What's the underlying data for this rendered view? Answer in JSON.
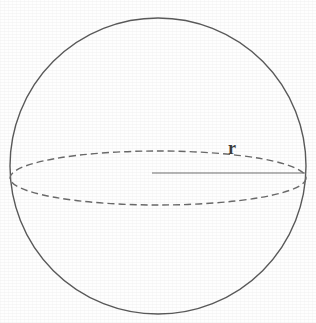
{
  "figure": {
    "kind": "sphere-radius-diagram",
    "background_color": "#fefefe",
    "width": 316,
    "height": 323
  },
  "chart_data": {
    "type": "diagram",
    "title": "",
    "subtitle": "",
    "xlabel": "",
    "ylabel": "",
    "annotations": [
      {
        "name": "radius-label",
        "text": "r",
        "x": 228,
        "y": 139,
        "font_size": 18,
        "bold": true,
        "color": "#3b3b3b"
      }
    ],
    "shapes": [
      {
        "name": "sphere-outline",
        "type": "circle",
        "cx": 158,
        "cy": 166,
        "r": 148,
        "stroke": "#5a5a5a",
        "stroke_width": 1.4,
        "dashed": false,
        "fill": "none"
      },
      {
        "name": "equator-ellipse",
        "type": "ellipse",
        "cx": 158,
        "cy": 178,
        "rx": 148,
        "ry": 27,
        "stroke": "#6a6a6a",
        "stroke_width": 1.4,
        "dashed": true,
        "dash_pattern": "7 4",
        "fill": "none"
      },
      {
        "name": "radius-line",
        "type": "line",
        "x1": 152,
        "y1": 173,
        "x2": 306,
        "y2": 173,
        "stroke": "#6e6e6e",
        "stroke_width": 1.2,
        "dashed": false
      }
    ],
    "legend": [],
    "grid": false
  }
}
